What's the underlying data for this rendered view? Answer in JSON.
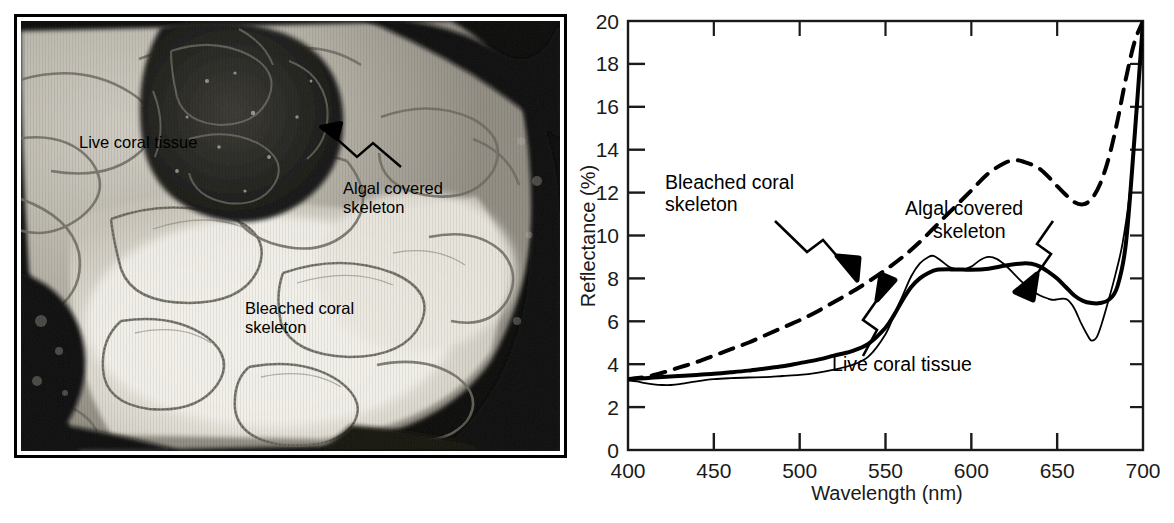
{
  "figure": {
    "panels": [
      "photograph",
      "reflectance-spectra-chart"
    ]
  },
  "photo": {
    "caption_labels": [
      {
        "id": "live-coral-tissue",
        "text": "Live coral tissue"
      },
      {
        "id": "algal-covered-skeleton",
        "text": "Algal covered\nskeleton"
      },
      {
        "id": "bleached-coral-skeleton",
        "text": "Bleached coral\nskeleton"
      }
    ],
    "subject": "brain coral colony showing live tissue, bleached skeleton and algal covered skeleton",
    "border_color": "#000000",
    "mount_color": "#ffffff"
  },
  "chart_data": {
    "type": "line",
    "title": "",
    "xlabel": "Wavelength (nm)",
    "ylabel": "Reflectance (%)",
    "xlim": [
      400,
      700
    ],
    "ylim": [
      0,
      20
    ],
    "xticks": [
      400,
      450,
      500,
      550,
      600,
      650,
      700
    ],
    "xticklabels": [
      "400",
      "450",
      "500",
      "550",
      "600",
      "650",
      "700"
    ],
    "yticks": [
      0,
      2,
      4,
      6,
      8,
      10,
      12,
      14,
      16,
      18,
      20
    ],
    "yticklabels": [
      "0",
      "2",
      "4",
      "6",
      "8",
      "10",
      "12",
      "14",
      "16",
      "18",
      "20"
    ],
    "grid": false,
    "legend": "none-inline-annotations",
    "series": [
      {
        "name": "Bleached coral skeleton",
        "style": "dashed",
        "color": "#000000",
        "width": 4,
        "x": [
          400,
          410,
          420,
          430,
          440,
          450,
          460,
          470,
          480,
          490,
          500,
          510,
          520,
          530,
          540,
          550,
          560,
          570,
          580,
          590,
          600,
          610,
          620,
          625,
          630,
          640,
          650,
          655,
          660,
          665,
          670,
          675,
          680,
          685,
          690,
          695,
          700
        ],
        "y": [
          3.3,
          3.4,
          3.6,
          3.85,
          4.1,
          4.4,
          4.7,
          5.0,
          5.35,
          5.7,
          6.05,
          6.45,
          6.9,
          7.35,
          7.85,
          8.4,
          9.0,
          9.7,
          10.5,
          11.3,
          12.1,
          12.9,
          13.4,
          13.5,
          13.45,
          13.1,
          12.3,
          11.9,
          11.55,
          11.45,
          11.7,
          12.4,
          13.6,
          15.3,
          17.3,
          19.0,
          20.0
        ]
      },
      {
        "name": "Algal covered skeleton",
        "style": "solid-thick",
        "color": "#000000",
        "width": 4,
        "x": [
          400,
          410,
          420,
          430,
          440,
          450,
          460,
          470,
          480,
          490,
          500,
          510,
          520,
          530,
          540,
          550,
          555,
          560,
          565,
          570,
          575,
          580,
          590,
          600,
          610,
          620,
          630,
          635,
          640,
          645,
          650,
          655,
          660,
          665,
          670,
          675,
          680,
          685,
          690,
          695,
          700
        ],
        "y": [
          3.3,
          3.35,
          3.4,
          3.45,
          3.5,
          3.55,
          3.62,
          3.7,
          3.8,
          3.9,
          4.05,
          4.2,
          4.4,
          4.6,
          4.95,
          5.7,
          6.3,
          7.0,
          7.6,
          8.0,
          8.25,
          8.4,
          8.42,
          8.4,
          8.45,
          8.6,
          8.7,
          8.68,
          8.55,
          8.3,
          8.0,
          7.6,
          7.2,
          6.95,
          6.85,
          6.85,
          7.0,
          7.6,
          9.6,
          14.5,
          20.0
        ]
      },
      {
        "name": "Live coral tissue",
        "style": "solid-thin",
        "color": "#000000",
        "width": 1.8,
        "x": [
          400,
          405,
          410,
          415,
          420,
          425,
          430,
          440,
          450,
          460,
          470,
          480,
          490,
          500,
          510,
          520,
          530,
          540,
          550,
          555,
          560,
          565,
          570,
          575,
          578,
          582,
          588,
          594,
          600,
          605,
          610,
          615,
          620,
          625,
          630,
          635,
          640,
          645,
          648,
          652,
          656,
          660,
          664,
          668,
          670,
          673,
          676,
          680,
          684,
          688,
          692,
          696,
          700
        ],
        "y": [
          3.25,
          3.2,
          3.12,
          3.06,
          3.03,
          3.03,
          3.07,
          3.2,
          3.3,
          3.35,
          3.38,
          3.4,
          3.45,
          3.5,
          3.6,
          3.75,
          3.95,
          4.35,
          5.4,
          6.3,
          7.2,
          8.1,
          8.7,
          9.0,
          9.05,
          8.85,
          8.5,
          8.4,
          8.55,
          8.85,
          9.0,
          8.9,
          8.6,
          8.2,
          7.8,
          7.45,
          7.2,
          7.05,
          7.0,
          7.05,
          7.0,
          6.6,
          5.9,
          5.3,
          5.1,
          5.25,
          5.9,
          7.0,
          8.2,
          9.6,
          11.8,
          15.5,
          20.0
        ]
      }
    ],
    "annotations": [
      {
        "id": "bleached-coral-skeleton",
        "text": "Bleached coral\nskeleton",
        "target_series": "Bleached coral skeleton"
      },
      {
        "id": "algal-covered-skeleton",
        "text": "Algal covered\nskeleton",
        "target_series": "Algal covered skeleton"
      },
      {
        "id": "live-coral-tissue",
        "text": "Live coral tissue",
        "target_series": "Live coral tissue"
      }
    ]
  }
}
